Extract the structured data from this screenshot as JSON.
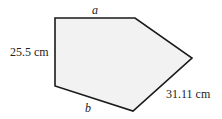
{
  "diagram": {
    "shape": "pentagon",
    "fill": "#f2f2f2",
    "stroke": "#1a1a1a",
    "vertices": [
      [
        55,
        18
      ],
      [
        135,
        18
      ],
      [
        192,
        58
      ],
      [
        133,
        111
      ],
      [
        55,
        86
      ]
    ],
    "labels": {
      "top": "a",
      "left": "25.5 cm",
      "bottom": "b",
      "right": "31.11 cm"
    }
  }
}
